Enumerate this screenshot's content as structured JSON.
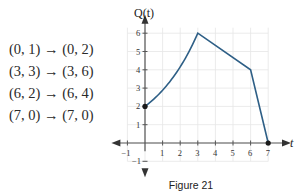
{
  "mappings": [
    {
      "label": "(0, 1) → (0, 2)"
    },
    {
      "label": "(3, 3) → (3, 6)"
    },
    {
      "label": "(6, 2) → (6, 4)"
    },
    {
      "label": "(7, 0) → (7, 0)"
    }
  ],
  "caption": "Figure 21",
  "chart_data": {
    "type": "line",
    "title": "",
    "xlabel": "t",
    "ylabel": "Q(t)",
    "xlim": [
      -1,
      7.5
    ],
    "ylim": [
      -1,
      6.5
    ],
    "grid": true,
    "x_ticks": [
      -1,
      1,
      2,
      3,
      4,
      5,
      6,
      7
    ],
    "y_ticks": [
      -1,
      1,
      2,
      3,
      4,
      5,
      6
    ],
    "series": [
      {
        "name": "Q(t)",
        "color": "#2e5f86",
        "points": [
          [
            0,
            2
          ],
          [
            1,
            2.7
          ],
          [
            2,
            3.8
          ],
          [
            3,
            6
          ],
          [
            6,
            4
          ],
          [
            7,
            0
          ]
        ],
        "segments": [
          {
            "from": [
              0,
              2
            ],
            "to": [
              3,
              6
            ],
            "shape": "curve (exponential-like, concave up)"
          },
          {
            "from": [
              3,
              6
            ],
            "to": [
              6,
              4
            ],
            "shape": "line"
          },
          {
            "from": [
              6,
              4
            ],
            "to": [
              7,
              0
            ],
            "shape": "line"
          }
        ],
        "marked_points": [
          [
            0,
            2
          ],
          [
            7,
            0
          ]
        ]
      }
    ]
  }
}
